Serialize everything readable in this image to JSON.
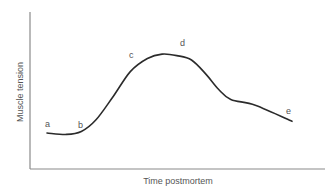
{
  "chart_data": {
    "type": "line",
    "title": "",
    "xlabel": "Time postmortem",
    "ylabel": "Muscle tension",
    "grid": false,
    "legend": null,
    "x_ticks": [],
    "y_ticks": [],
    "xlim": [
      0,
      100
    ],
    "ylim": [
      0,
      100
    ],
    "series": [
      {
        "name": "Muscle tension curve",
        "color": "#2b2b2b",
        "x": [
          0,
          8,
          14,
          20,
          27,
          34,
          41,
          47,
          53,
          59,
          65,
          70,
          75,
          85,
          100
        ],
        "y": [
          24,
          23,
          25,
          33,
          49,
          66,
          75,
          78,
          77,
          74,
          64,
          54,
          47,
          43,
          32
        ]
      }
    ],
    "annotations": [
      {
        "text": "a",
        "x": 0,
        "y": 24,
        "note": "pre-rigor, low tension"
      },
      {
        "text": "b",
        "x": 14,
        "y": 25,
        "note": "onset of rigor"
      },
      {
        "text": "c",
        "x": 34,
        "y": 66,
        "note": "rising toward full rigor"
      },
      {
        "text": "d",
        "x": 55,
        "y": 77,
        "note": "full rigor / peak"
      },
      {
        "text": "e",
        "x": 100,
        "y": 32,
        "note": "resolution of rigor"
      }
    ]
  },
  "labels": {
    "x_axis": "Time postmortem",
    "y_axis": "Muscle tension",
    "a": "a",
    "b": "b",
    "c": "c",
    "d": "d",
    "e": "e"
  },
  "colors": {
    "axis": "#8a8a8a",
    "curve": "#2b2b2b",
    "text": "#555555",
    "background": "#ffffff"
  }
}
